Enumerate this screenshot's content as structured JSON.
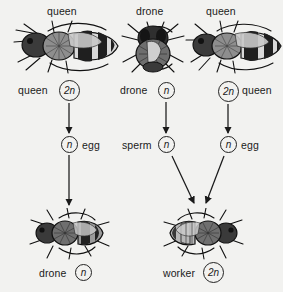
{
  "diagram": {
    "background_color": "#f2f2f0",
    "ink_color": "#1a1a1a"
  },
  "top_labels": [
    {
      "text": "queen"
    },
    {
      "text": "drone"
    },
    {
      "text": "queen"
    }
  ],
  "parents": [
    {
      "name": "queen-bee-left",
      "caste": "queen",
      "ploidy": "2n",
      "label": "queen",
      "ploidy_side": "right"
    },
    {
      "name": "drone-bee-middle",
      "caste": "drone",
      "ploidy": "n",
      "label": "drone",
      "ploidy_side": "right"
    },
    {
      "name": "queen-bee-right",
      "caste": "queen",
      "ploidy": "2n",
      "label": "queen",
      "ploidy_side": "left"
    }
  ],
  "gametes": [
    {
      "name": "egg-left",
      "ploidy": "n",
      "label": "egg",
      "ploidy_side": "left"
    },
    {
      "name": "sperm-middle",
      "ploidy": "n",
      "label": "sperm",
      "ploidy_side": "right"
    },
    {
      "name": "egg-right",
      "ploidy": "n",
      "label": "egg",
      "ploidy_side": "left"
    }
  ],
  "offspring": [
    {
      "name": "drone-offspring",
      "caste": "drone",
      "label": "drone",
      "ploidy": "n"
    },
    {
      "name": "worker-offspring",
      "caste": "worker",
      "label": "worker",
      "ploidy": "2n"
    }
  ],
  "arrows": [
    {
      "name": "arrow-queen-to-egg",
      "type": "vertical"
    },
    {
      "name": "arrow-egg-to-drone",
      "type": "vertical"
    },
    {
      "name": "arrow-drone-to-sperm",
      "type": "vertical"
    },
    {
      "name": "arrow-queen-to-egg-right",
      "type": "vertical"
    },
    {
      "name": "arrow-sperm-to-worker",
      "type": "diagonal"
    },
    {
      "name": "arrow-egg-to-worker",
      "type": "diagonal"
    }
  ]
}
